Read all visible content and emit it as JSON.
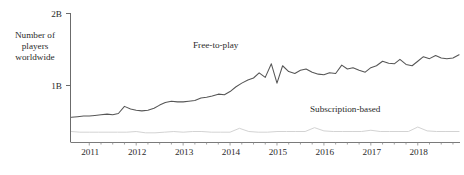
{
  "chart_data": {
    "type": "line",
    "title": "",
    "xlabel": "",
    "ylabel": "Number of players worldwide",
    "ylim": [
      0,
      2
    ],
    "xlim": [
      2010.6,
      2018.9
    ],
    "yticks": [
      "1B",
      "2B"
    ],
    "ytick_values": [
      1,
      2
    ],
    "grid": false,
    "legend_position": "inline-annotation",
    "categories": [
      "2011",
      "2012",
      "2013",
      "2014",
      "2015",
      "2016",
      "2017",
      "2018"
    ],
    "annotations": [
      {
        "text": "Free-to-play",
        "series": "Free-to-play"
      },
      {
        "text": "Subscription-based",
        "series": "Subscription-based"
      }
    ],
    "series": [
      {
        "name": "Free-to-play",
        "color": "#565656",
        "x": [
          2010.62,
          2010.75,
          2010.88,
          2011.0,
          2011.12,
          2011.25,
          2011.38,
          2011.5,
          2011.62,
          2011.75,
          2011.88,
          2012.0,
          2012.12,
          2012.25,
          2012.38,
          2012.5,
          2012.62,
          2012.75,
          2012.88,
          2013.0,
          2013.12,
          2013.25,
          2013.38,
          2013.5,
          2013.62,
          2013.75,
          2013.88,
          2014.0,
          2014.12,
          2014.25,
          2014.38,
          2014.5,
          2014.62,
          2014.75,
          2014.88,
          2015.0,
          2015.12,
          2015.25,
          2015.38,
          2015.5,
          2015.62,
          2015.75,
          2015.88,
          2016.0,
          2016.12,
          2016.25,
          2016.38,
          2016.5,
          2016.62,
          2016.75,
          2016.88,
          2017.0,
          2017.12,
          2017.25,
          2017.38,
          2017.5,
          2017.62,
          2017.75,
          2017.88,
          2018.0,
          2018.12,
          2018.25,
          2018.38,
          2018.5,
          2018.62,
          2018.75,
          2018.88
        ],
        "values": [
          0.39,
          0.4,
          0.41,
          0.41,
          0.42,
          0.43,
          0.44,
          0.43,
          0.45,
          0.56,
          0.52,
          0.5,
          0.49,
          0.5,
          0.53,
          0.58,
          0.62,
          0.64,
          0.63,
          0.63,
          0.64,
          0.65,
          0.69,
          0.7,
          0.72,
          0.75,
          0.74,
          0.79,
          0.86,
          0.92,
          0.97,
          1.0,
          1.08,
          1.01,
          1.22,
          0.92,
          1.19,
          1.1,
          1.07,
          1.12,
          1.14,
          1.09,
          1.06,
          1.05,
          1.08,
          1.07,
          1.2,
          1.14,
          1.16,
          1.12,
          1.09,
          1.16,
          1.19,
          1.26,
          1.23,
          1.22,
          1.29,
          1.21,
          1.19,
          1.26,
          1.33,
          1.3,
          1.35,
          1.31,
          1.3,
          1.31,
          1.36
        ]
      },
      {
        "name": "Subscription-based",
        "color": "#d3d3d3",
        "x": [
          2010.62,
          2010.8,
          2011.0,
          2011.2,
          2011.4,
          2011.6,
          2011.8,
          2012.0,
          2012.2,
          2012.4,
          2012.6,
          2012.8,
          2013.0,
          2013.2,
          2013.4,
          2013.6,
          2013.8,
          2014.0,
          2014.2,
          2014.4,
          2014.6,
          2014.8,
          2015.0,
          2015.2,
          2015.4,
          2015.6,
          2015.8,
          2016.0,
          2016.2,
          2016.4,
          2016.6,
          2016.8,
          2017.0,
          2017.2,
          2017.4,
          2017.6,
          2017.8,
          2018.0,
          2018.2,
          2018.4,
          2018.6,
          2018.88
        ],
        "values": [
          0.17,
          0.16,
          0.16,
          0.16,
          0.16,
          0.16,
          0.16,
          0.17,
          0.15,
          0.15,
          0.16,
          0.17,
          0.16,
          0.17,
          0.17,
          0.16,
          0.16,
          0.16,
          0.22,
          0.17,
          0.16,
          0.16,
          0.17,
          0.17,
          0.17,
          0.17,
          0.23,
          0.18,
          0.17,
          0.17,
          0.17,
          0.17,
          0.19,
          0.17,
          0.17,
          0.17,
          0.17,
          0.24,
          0.18,
          0.17,
          0.17,
          0.17
        ]
      }
    ]
  },
  "axis": {
    "y_title": "Number of players worldwide",
    "ytick_top": "2B",
    "ytick_mid": "1B"
  },
  "colors": {
    "free_to_play": "#565656",
    "subscription": "#d3d3d3",
    "axis": "#6b6b6b",
    "text": "#2b2b2b"
  }
}
